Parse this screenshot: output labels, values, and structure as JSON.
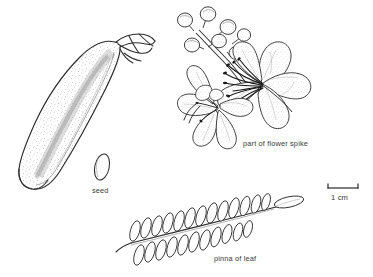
{
  "plate": {
    "type": "botanical-line-drawing",
    "background_color": "#ffffff",
    "ink_color": "#2b2b2b",
    "stipple_color": "#8a8a8a",
    "caption_color": "#3b3b3b"
  },
  "labels": {
    "flower_spike": "part of flower spike",
    "seed": "seed",
    "pinna": "pinna of leaf",
    "scale": "1 cm"
  },
  "scale_bar": {
    "label": "1 cm",
    "length_px": 30,
    "tick_height_px": 4
  },
  "specimens": [
    {
      "name": "pod",
      "label": "",
      "description": "large curved seed pod with stippled surface and beaked tip"
    },
    {
      "name": "seed",
      "label": "seed",
      "description": "small elongate oval seed"
    },
    {
      "name": "flower-spike",
      "label": "part of flower spike",
      "description": "inflorescence with round buds and open flowers bearing long curved stamens"
    },
    {
      "name": "pinna-of-leaf",
      "label": "pinna of leaf",
      "description": "pinnate leaf segment with opposite oval leaflets along a rachis"
    }
  ],
  "leaf": {
    "leaflet_pairs": 13,
    "terminal_leaflet": true
  },
  "flower": {
    "open_flowers": 2,
    "buds": 6,
    "stamens": 9
  }
}
